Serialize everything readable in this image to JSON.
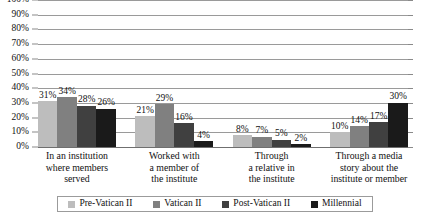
{
  "chart_data": {
    "type": "bar",
    "title": "",
    "subtitle": "",
    "xlabel": "",
    "ylabel": "",
    "ylim": [
      0,
      100
    ],
    "grid": true,
    "legend_position": "bottom",
    "value_suffix": "%",
    "y_ticks": [
      "0%",
      "10%",
      "20%",
      "30%",
      "40%",
      "50%",
      "60%",
      "70%",
      "80%",
      "90%",
      "100%"
    ],
    "y_tick_values": [
      0,
      10,
      20,
      30,
      40,
      50,
      60,
      70,
      80,
      90,
      100
    ],
    "categories": [
      "In an institution where members served",
      "Worked with a member of the institute",
      "Through a relative in the institute",
      "Through a media story about the institute or member"
    ],
    "category_lines": [
      [
        "In an institution",
        "where members",
        "served"
      ],
      [
        "Worked with",
        "a member of",
        "the institute"
      ],
      [
        "Through",
        "a relative in",
        "the institute"
      ],
      [
        "Through a media",
        "story about the",
        "institute or member"
      ]
    ],
    "series": [
      {
        "name": "Pre-Vatican II",
        "color": "#bdbdbd",
        "values": [
          31,
          21,
          8,
          10
        ],
        "labels": [
          "31%",
          "21%",
          "8%",
          "10%"
        ]
      },
      {
        "name": "Vatican II",
        "color": "#808080",
        "values": [
          34,
          29,
          7,
          14
        ],
        "labels": [
          "34%",
          "29%",
          "7%",
          "14%"
        ]
      },
      {
        "name": "Post-Vatican II",
        "color": "#404040",
        "values": [
          28,
          16,
          5,
          17
        ],
        "labels": [
          "28%",
          "16%",
          "5%",
          "17%"
        ]
      },
      {
        "name": "Millennial",
        "color": "#1a1a1a",
        "values": [
          26,
          4,
          2,
          30
        ],
        "labels": [
          "26%",
          "4%",
          "2%",
          "30%"
        ]
      }
    ]
  }
}
